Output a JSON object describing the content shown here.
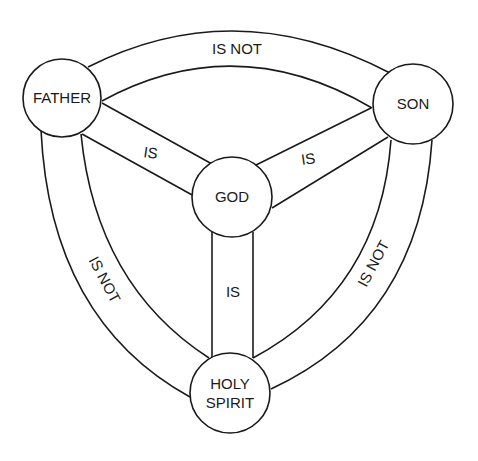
{
  "diagram": {
    "colors": {
      "stroke": "#1a1a1a",
      "background": "#ffffff",
      "text": "#1a1a1a"
    },
    "nodes": {
      "father": {
        "label": "FATHER"
      },
      "son": {
        "label": "SON"
      },
      "god": {
        "label": "GOD"
      },
      "holy_spirit": {
        "label_line1": "HOLY",
        "label_line2": "SPIRIT"
      }
    },
    "edges": {
      "father_son": {
        "label": "IS NOT"
      },
      "father_holy_spirit": {
        "label": "IS NOT"
      },
      "son_holy_spirit": {
        "label": "IS NOT"
      },
      "father_god": {
        "label": "IS"
      },
      "son_god": {
        "label": "IS"
      },
      "holy_spirit_god": {
        "label": "IS"
      }
    }
  }
}
